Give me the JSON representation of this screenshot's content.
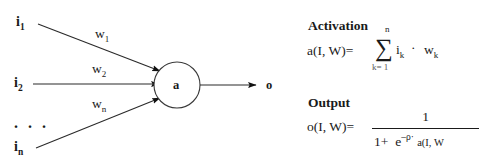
{
  "figure": {
    "type": "neuron-diagram",
    "background_color": "#ffffff",
    "ink_color": "#1a1a1a"
  },
  "diagram": {
    "node_label": "a",
    "output_label": "o",
    "ellipsis": ". . .",
    "inputs": [
      {
        "label": "i",
        "subscript": "1"
      },
      {
        "label": "i",
        "subscript": "2"
      },
      {
        "label": "i",
        "subscript": "n"
      }
    ],
    "weights": [
      {
        "label": "w",
        "subscript": "1"
      },
      {
        "label": "w",
        "subscript": "2"
      },
      {
        "label": "w",
        "subscript": "n"
      }
    ]
  },
  "formulas": {
    "activation": {
      "title": "Activation",
      "lhs": "a(I,  W)=",
      "sum_symbol": "∑",
      "sum_upper": "n",
      "sum_lower": "k=  1",
      "summand_i": "i",
      "summand_i_sub": "k",
      "operator": "·",
      "summand_w": "w",
      "summand_w_sub": "k"
    },
    "output": {
      "title": "Output",
      "lhs": "o(I,  W)=",
      "numerator": "1",
      "denominator_lead": "1+",
      "denominator_e": "e",
      "denominator_exp_sign": "–",
      "denominator_exp_rho": "ρ",
      "denominator_exp_dot": "·",
      "denominator_exp_activation": "a(I,  W"
    }
  }
}
